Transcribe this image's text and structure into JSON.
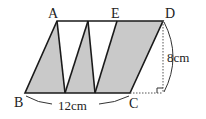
{
  "diagram": {
    "type": "geometry-parallelogram",
    "points": {
      "A": {
        "label": "A"
      },
      "B": {
        "label": "B"
      },
      "C": {
        "label": "C"
      },
      "D": {
        "label": "D"
      },
      "E": {
        "label": "E"
      }
    },
    "dimensions": {
      "base": "12cm",
      "height": "8cm"
    },
    "colors": {
      "shade": "#c8c8c8",
      "line": "#1a1a1a"
    }
  }
}
